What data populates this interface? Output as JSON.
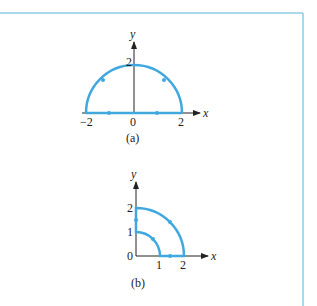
{
  "colors": {
    "border": "#8fcbe4",
    "curve": "#40a8df",
    "axis": "#222222"
  },
  "figure_a": {
    "caption": "(a)",
    "x_axis_label": "x",
    "y_axis_label": "y",
    "x_ticks": [
      "−2",
      "0",
      "2"
    ],
    "y_ticks": [
      "2"
    ],
    "description": "Closed contour: upper semicircle of radius 2 from (2,0) to (−2,0), then straight segment along x-axis from −2 to 2, with direction arrows"
  },
  "figure_b": {
    "caption": "(b)",
    "x_axis_label": "x",
    "y_axis_label": "y",
    "x_ticks": [
      "1",
      "2"
    ],
    "y_ticks": [
      "0",
      "1",
      "2"
    ],
    "description": "Closed contour in first quadrant: quarter circle radius 2, down y-axis from 2 to 1, quarter circle radius 1, along x-axis from 1 to 2"
  }
}
